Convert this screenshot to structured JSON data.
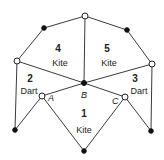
{
  "diagram": {
    "vertices": [
      {
        "id": "top",
        "type": "open"
      },
      {
        "id": "upper-left",
        "type": "filled"
      },
      {
        "id": "upper-right",
        "type": "filled"
      },
      {
        "id": "left",
        "type": "open"
      },
      {
        "id": "right",
        "type": "open"
      },
      {
        "id": "B",
        "type": "filled",
        "label": "B"
      },
      {
        "id": "A",
        "type": "open",
        "label": "A"
      },
      {
        "id": "C",
        "type": "open",
        "label": "C"
      },
      {
        "id": "bottom-left",
        "type": "filled"
      },
      {
        "id": "bottom-right",
        "type": "filled"
      },
      {
        "id": "bottom",
        "type": "filled"
      }
    ],
    "tiles": [
      {
        "number": "1",
        "shape": "Kite"
      },
      {
        "number": "2",
        "shape": "Dart"
      },
      {
        "number": "3",
        "shape": "Dart"
      },
      {
        "number": "4",
        "shape": "Kite"
      },
      {
        "number": "5",
        "shape": "Kite"
      }
    ],
    "point_labels": {
      "A": "A",
      "B": "B",
      "C": "C"
    }
  }
}
